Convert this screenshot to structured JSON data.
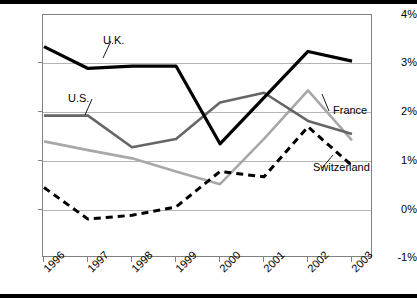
{
  "chart_data": {
    "type": "line",
    "title": "",
    "xlabel": "",
    "ylabel": "",
    "categories": [
      "1996",
      "1997",
      "1998",
      "1999",
      "2000",
      "2001",
      "2002",
      "2003"
    ],
    "ylim": [
      -1,
      4
    ],
    "yticks": [
      "-1%",
      "0%",
      "1%",
      "2%",
      "3%",
      "4%"
    ],
    "ytick_values": [
      -1,
      0,
      1,
      2,
      3,
      4
    ],
    "grid": true,
    "legend_position": "inline-annotations",
    "series": [
      {
        "name": "U.K.",
        "style": "solid-thick-black",
        "color": "#000000",
        "values": [
          3.35,
          2.9,
          2.95,
          2.95,
          1.35,
          2.3,
          3.25,
          3.05
        ]
      },
      {
        "name": "U.S.",
        "style": "solid-medium-gray",
        "color": "#666666",
        "values": [
          1.93,
          1.93,
          1.28,
          1.45,
          2.2,
          2.4,
          1.82,
          1.55
        ]
      },
      {
        "name": "France",
        "style": "solid-light-gray",
        "color": "#a8a8a8",
        "values": [
          1.4,
          1.22,
          1.05,
          0.78,
          0.52,
          1.45,
          2.45,
          1.42
        ]
      },
      {
        "name": "Switzerland",
        "style": "dashed-black",
        "color": "#000000",
        "values": [
          0.45,
          -0.2,
          -0.12,
          0.05,
          0.78,
          0.67,
          1.7,
          0.9
        ]
      }
    ],
    "annotations": [
      {
        "text": "U.K.",
        "series": "U.K."
      },
      {
        "text": "U.S.",
        "series": "U.S."
      },
      {
        "text": "France",
        "series": "France"
      },
      {
        "text": "Switzerland",
        "series": "Switzerland"
      }
    ]
  }
}
